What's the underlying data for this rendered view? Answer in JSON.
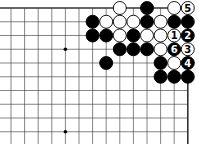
{
  "diagram": {
    "type": "go-board-fragment",
    "grid": {
      "columns": 14,
      "rows": 11,
      "origin_x": 11,
      "origin_y": 8,
      "spacing_x": 13.6,
      "spacing_y": 13.75,
      "top_edge": true,
      "right_edge": true,
      "left_edge": false,
      "bottom_edge": false
    },
    "colors": {
      "line": "#333333",
      "black_stone": "#000000",
      "white_stone": "#ffffff",
      "stone_outline": "#000000"
    },
    "hoshi": [
      {
        "col": 4,
        "row": 3
      },
      {
        "col": 4,
        "row": 9
      }
    ],
    "stones": [
      {
        "col": 8,
        "row": 0,
        "color": "white"
      },
      {
        "col": 10,
        "row": 0,
        "color": "black"
      },
      {
        "col": 12,
        "row": 0,
        "color": "white"
      },
      {
        "col": 13,
        "row": 0,
        "color": "white",
        "label": "5"
      },
      {
        "col": 6,
        "row": 1,
        "color": "black"
      },
      {
        "col": 7,
        "row": 1,
        "color": "white"
      },
      {
        "col": 8,
        "row": 1,
        "color": "white"
      },
      {
        "col": 9,
        "row": 1,
        "color": "white"
      },
      {
        "col": 10,
        "row": 1,
        "color": "black"
      },
      {
        "col": 11,
        "row": 1,
        "color": "white"
      },
      {
        "col": 12,
        "row": 1,
        "color": "black"
      },
      {
        "col": 13,
        "row": 1,
        "color": "black"
      },
      {
        "col": 6,
        "row": 2,
        "color": "black"
      },
      {
        "col": 7,
        "row": 2,
        "color": "black"
      },
      {
        "col": 8,
        "row": 2,
        "color": "white"
      },
      {
        "col": 9,
        "row": 2,
        "color": "black"
      },
      {
        "col": 10,
        "row": 2,
        "color": "white"
      },
      {
        "col": 11,
        "row": 2,
        "color": "white"
      },
      {
        "col": 12,
        "row": 2,
        "color": "white",
        "label": "1"
      },
      {
        "col": 13,
        "row": 2,
        "color": "black",
        "label": "2"
      },
      {
        "col": 8,
        "row": 3,
        "color": "black"
      },
      {
        "col": 9,
        "row": 3,
        "color": "black"
      },
      {
        "col": 10,
        "row": 3,
        "color": "black"
      },
      {
        "col": 11,
        "row": 3,
        "color": "white"
      },
      {
        "col": 12,
        "row": 3,
        "color": "black",
        "label": "6"
      },
      {
        "col": 13,
        "row": 3,
        "color": "white",
        "label": "3"
      },
      {
        "col": 7,
        "row": 4,
        "color": "black"
      },
      {
        "col": 11,
        "row": 4,
        "color": "black"
      },
      {
        "col": 12,
        "row": 4,
        "color": "white"
      },
      {
        "col": 13,
        "row": 4,
        "color": "black",
        "label": "4"
      },
      {
        "col": 11,
        "row": 5,
        "color": "black"
      },
      {
        "col": 12,
        "row": 5,
        "color": "black"
      },
      {
        "col": 13,
        "row": 5,
        "color": "black"
      }
    ]
  }
}
